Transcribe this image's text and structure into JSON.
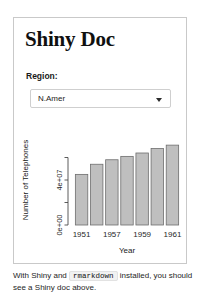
{
  "document": {
    "title": "Shiny Doc",
    "border_color": "#c9c9c9"
  },
  "controls": {
    "region_label": "Region:",
    "region_selected": "N.Amer",
    "region_options": [
      "N.Amer"
    ],
    "dropdown_icon": "chevron-down-icon"
  },
  "footer": {
    "text_before": "With Shiny and",
    "code": "rmarkdown",
    "text_after": "installed, you should see a Shiny doc above."
  },
  "chart_data": {
    "type": "bar",
    "title": "",
    "xlabel": "Year",
    "ylabel": "Number of Telephones",
    "categories": [
      "1951",
      "1956",
      "1957",
      "1958",
      "1959",
      "1960",
      "1961"
    ],
    "tick_labels": [
      "1951",
      "1957",
      "1959",
      "1961"
    ],
    "tick_indices": [
      0,
      2,
      4,
      6
    ],
    "values": [
      45000000,
      54000000,
      58000000,
      61000000,
      64000000,
      68000000,
      71000000
    ],
    "ylim": [
      0,
      80000000
    ],
    "ytick_values": [
      0,
      20000000,
      40000000,
      60000000
    ],
    "ytick_labels": [
      "0e+00",
      "",
      "4e+07",
      ""
    ],
    "ylabeled_ticks": [
      "0e+00",
      "4e+07"
    ],
    "grid": false,
    "legend": "none",
    "bar_fill": "#bfbfbf",
    "bar_stroke": "#6e6e6e",
    "axis_color": "#4a4a4a"
  }
}
